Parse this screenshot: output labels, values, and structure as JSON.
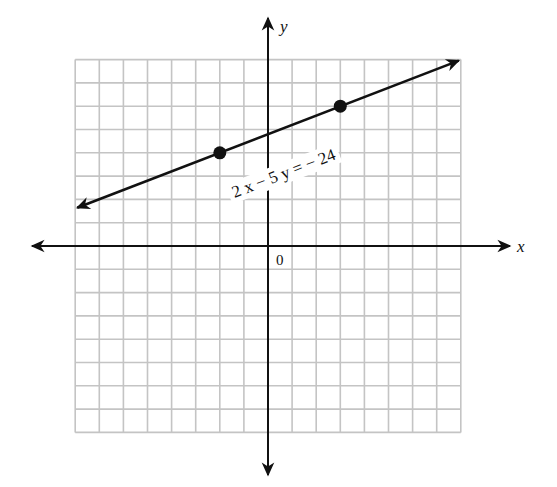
{
  "chart_data": {
    "type": "line",
    "title": "",
    "xlabel": "x",
    "ylabel": "y",
    "origin_label": "0",
    "xlim": [
      -8,
      8
    ],
    "ylim": [
      -8,
      8
    ],
    "grid": true,
    "grid_step": 1,
    "tick_labels": [],
    "series": [
      {
        "name": "2x - 5y = -24",
        "equation": "2x - 5y = -24",
        "slope": 0.4,
        "y_intercept": 4.8,
        "extends_both_directions": true,
        "line_from": [
          -8,
          1.6
        ],
        "line_to": [
          8,
          8
        ],
        "marked_points": [
          {
            "x": -2,
            "y": 4
          },
          {
            "x": 3,
            "y": 6
          }
        ]
      }
    ],
    "annotations": [
      {
        "text": "2 x − 5 y = − 24",
        "anchor": [
          1.1,
          2.4
        ],
        "rotation_deg": -21
      }
    ],
    "legend": null
  },
  "labels": {
    "x_axis": "x",
    "y_axis": "y",
    "origin": "0",
    "equation": "2 x − 5 y = − 24"
  },
  "colors": {
    "grid": "#c4c4c4",
    "ink": "#111111",
    "background": "#ffffff"
  }
}
